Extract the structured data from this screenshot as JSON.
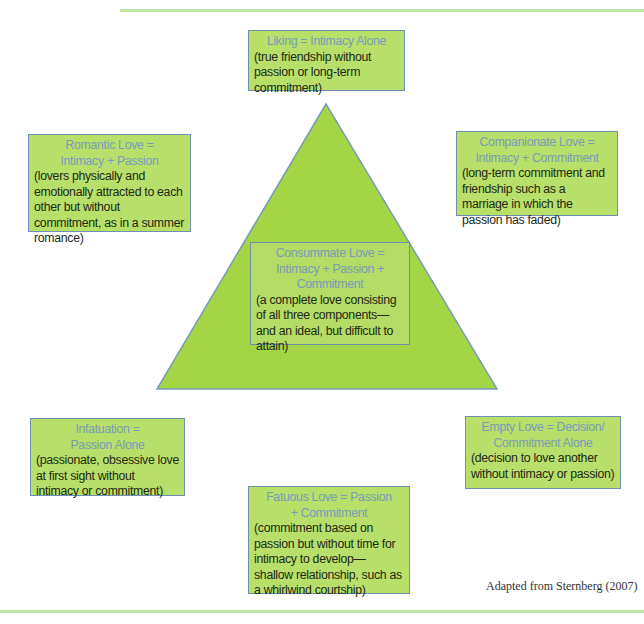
{
  "figure": {
    "colors": {
      "box_fill": "#b8df6a",
      "box_border": "#6f8fb0",
      "title_text": "#7a9ab8",
      "desc_text": "#1f2a14",
      "triangle_fill": "#a4d544",
      "rule": "#bfe6a4"
    },
    "boxes": {
      "liking": {
        "title": "Liking = Intimacy Alone",
        "desc": "(true friendship without passion or long-term commitment)"
      },
      "romantic": {
        "title": "Romantic Love = Intimacy + Passion",
        "desc": "(lovers physically and emotionally attracted to each other but without commitment, as in a summer romance)"
      },
      "companionate": {
        "title": "Companionate Love = Intimacy + Commitment",
        "desc": "(long-term commitment and friendship such as a marriage in which the passion has faded)"
      },
      "consummate": {
        "title": "Consummate Love = Intimacy + Passion + Commitment",
        "desc": "(a complete love consisting of all three components—and an ideal, but difficult to attain)"
      },
      "infatuation": {
        "title": "Infatuation = Passion Alone",
        "desc": "(passionate, obsessive love at first sight without intimacy or commitment)"
      },
      "empty": {
        "title": "Empty Love = Decision/ Commitment Alone",
        "desc": "(decision to love another without intimacy or passion)"
      },
      "fatuous": {
        "title": "Fatuous Love = Passion + Commitment",
        "desc": "(commitment based on passion but without time for intimacy to develop—shallow relationship, such as a whirlwind courtship)"
      }
    },
    "credit": "Adapted from Sternberg (2007)"
  }
}
